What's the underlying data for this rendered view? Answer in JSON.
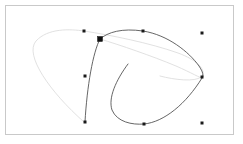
{
  "app": {
    "surface_name": "vector-path-canvas",
    "background_color": "#ffffff"
  },
  "artboard": {
    "label": "Artboard",
    "x": 5,
    "y": 5,
    "width": 228,
    "height": 129,
    "fill_color": "#ffffff",
    "border_color": "#c9c9c9",
    "border_width": 1
  },
  "paths": [
    {
      "id": "path-light-loop",
      "label": "Light outer loop path",
      "stroke_color": "#dcdcdc",
      "stroke_width": 0.85,
      "fill": "none",
      "d": "M 84 122 C 50 92 24 55 36 41 C 48 28 70 29 84 31 C 110 35 150 43 178 53 C 200 61 207 72 201 77 C 195 82 175 80 160 76"
    },
    {
      "id": "path-light-tail",
      "label": "Light inner tail path",
      "stroke_color": "#dcdcdc",
      "stroke_width": 0.8,
      "fill": "none",
      "d": "M 100 39 C 120 45 152 56 176 66 C 192 73 200 78 202 78"
    },
    {
      "id": "path-dark-arc",
      "label": "Dark upper arc path",
      "stroke_color": "#4a4a4a",
      "stroke_width": 0.85,
      "fill": "none",
      "d": "M 100 39 C 108 32 122 28 143 31 C 168 35 189 52 199 66 C 203 72 204 76 202 78"
    },
    {
      "id": "path-dark-drop",
      "label": "Dark descending stem path",
      "stroke_color": "#4a4a4a",
      "stroke_width": 0.85,
      "fill": "none",
      "d": "M 100 39 C 93 52 87 86 85 122"
    },
    {
      "id": "path-dark-hook",
      "label": "Dark hook path",
      "stroke_color": "#4a4a4a",
      "stroke_width": 0.85,
      "fill": "none",
      "d": "M 128 64 C 116 80 108 98 112 110 C 117 122 132 125 144 124 C 164 122 186 104 202 78"
    }
  ],
  "anchors": [
    {
      "id": "anchor-top-left",
      "label": "Anchor point top left",
      "x": 84,
      "y": 31,
      "size": 3,
      "selected": false
    },
    {
      "id": "anchor-main-selected",
      "label": "Selected anchor point",
      "x": 100,
      "y": 39,
      "size": 5,
      "selected": true
    },
    {
      "id": "anchor-top-mid",
      "label": "Anchor point top middle",
      "x": 143,
      "y": 31,
      "size": 3,
      "selected": false
    },
    {
      "id": "anchor-top-right",
      "label": "Anchor point top right",
      "x": 202,
      "y": 33,
      "size": 3,
      "selected": false
    },
    {
      "id": "anchor-left-mid",
      "label": "Anchor point left middle",
      "x": 85,
      "y": 76,
      "size": 3,
      "selected": false
    },
    {
      "id": "anchor-right-mid",
      "label": "Anchor point right middle",
      "x": 202,
      "y": 77,
      "size": 3,
      "selected": false
    },
    {
      "id": "anchor-bottom-left",
      "label": "Anchor point bottom left",
      "x": 85,
      "y": 122,
      "size": 3,
      "selected": false
    },
    {
      "id": "anchor-bottom-mid",
      "label": "Anchor point bottom middle",
      "x": 144,
      "y": 124,
      "size": 3,
      "selected": false
    },
    {
      "id": "anchor-bottom-right",
      "label": "Anchor point bottom right",
      "x": 202,
      "y": 123,
      "size": 3,
      "selected": false
    }
  ],
  "colors": {
    "stroke_dark": "#4a4a4a",
    "stroke_light": "#dcdcdc",
    "anchor_fill": "#1a1a1a",
    "frame_border": "#c9c9c9",
    "canvas_background": "#ffffff"
  }
}
